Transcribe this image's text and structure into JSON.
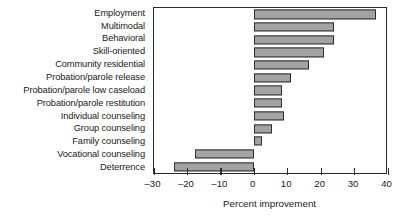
{
  "chart_data": {
    "type": "bar",
    "orientation": "horizontal",
    "title": "",
    "subtitle": "",
    "xlabel": "Percent improvement",
    "ylabel": "",
    "xlim": [
      -30,
      40
    ],
    "xticks": [
      -30,
      -20,
      -10,
      0,
      10,
      20,
      30,
      40
    ],
    "xticklabels": [
      "–30",
      "–20",
      "–10",
      "0",
      "10",
      "20",
      "30",
      "40"
    ],
    "grid": false,
    "legend": null,
    "zero_line": 0,
    "bar_color": "#a3a3a3",
    "bar_edge_color": "#2e2e2e",
    "axis_color": "#2b2b2b",
    "categories": [
      "Employment",
      "Multimodal",
      "Behavioral",
      "Skill-oriented",
      "Community residential",
      "Probation/parole release",
      "Probation/parole low caseload",
      "Probation/parole restitution",
      "Individual counseling",
      "Group counseling",
      "Family counseling",
      "Vocational counseling",
      "Deterrence"
    ],
    "values": [
      36.5,
      24.0,
      24.0,
      21.0,
      16.5,
      11.0,
      8.5,
      8.5,
      9.0,
      5.5,
      2.5,
      -17.5,
      -24.0
    ]
  }
}
